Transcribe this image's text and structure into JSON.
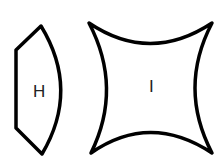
{
  "diagram": {
    "shapes": [
      {
        "id": "H",
        "label": "H",
        "description": "hexagon-like shape with curved right side"
      },
      {
        "id": "I",
        "label": "I",
        "description": "four-pointed shape with concave curved sides"
      }
    ],
    "stroke_color": "#000000",
    "background": "#ffffff"
  }
}
